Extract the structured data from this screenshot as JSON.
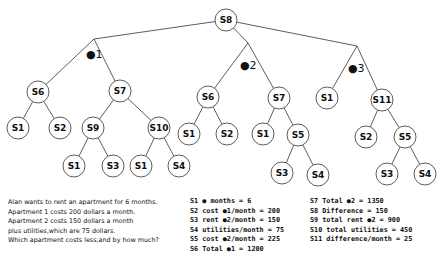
{
  "diagram": {
    "type": "tree",
    "root": "S8",
    "branches": [
      {
        "label": "#1",
        "display": "●1"
      },
      {
        "label": "#2",
        "display": "●2"
      },
      {
        "label": "#3",
        "display": "●3"
      }
    ],
    "nodes": [
      {
        "id": "n_s8",
        "label": "S8",
        "x": 226,
        "y": 20
      },
      {
        "id": "b1",
        "label": "",
        "x": 94,
        "y": 39,
        "branch": true
      },
      {
        "id": "b2",
        "label": "",
        "x": 248,
        "y": 43,
        "branch": true
      },
      {
        "id": "b3",
        "label": "",
        "x": 357,
        "y": 46,
        "branch": true
      },
      {
        "id": "n1_s6",
        "label": "S6",
        "x": 38,
        "y": 92
      },
      {
        "id": "n1_s7",
        "label": "S7",
        "x": 120,
        "y": 91
      },
      {
        "id": "n1_s1a",
        "label": "S1",
        "x": 18,
        "y": 128
      },
      {
        "id": "n1_s2",
        "label": "S2",
        "x": 60,
        "y": 128
      },
      {
        "id": "n1_s9",
        "label": "S9",
        "x": 93,
        "y": 128
      },
      {
        "id": "n1_s10",
        "label": "S10",
        "x": 159,
        "y": 128
      },
      {
        "id": "n1_s1b",
        "label": "S1",
        "x": 74,
        "y": 166
      },
      {
        "id": "n1_s3",
        "label": "S3",
        "x": 113,
        "y": 166
      },
      {
        "id": "n1_s1c",
        "label": "S1",
        "x": 141,
        "y": 166
      },
      {
        "id": "n1_s4",
        "label": "S4",
        "x": 179,
        "y": 166
      },
      {
        "id": "n2_s6",
        "label": "S6",
        "x": 208,
        "y": 97
      },
      {
        "id": "n2_s7",
        "label": "S7",
        "x": 279,
        "y": 98
      },
      {
        "id": "n2_s1a",
        "label": "S1",
        "x": 189,
        "y": 134
      },
      {
        "id": "n2_s2",
        "label": "S2",
        "x": 227,
        "y": 134
      },
      {
        "id": "n2_s1b",
        "label": "S1",
        "x": 263,
        "y": 134
      },
      {
        "id": "n2_s5",
        "label": "S5",
        "x": 298,
        "y": 135
      },
      {
        "id": "n2_s3",
        "label": "S3",
        "x": 282,
        "y": 173
      },
      {
        "id": "n2_s4",
        "label": "S4",
        "x": 318,
        "y": 175
      },
      {
        "id": "n3_s1",
        "label": "S1",
        "x": 327,
        "y": 98
      },
      {
        "id": "n3_s11",
        "label": "S11",
        "x": 382,
        "y": 100
      },
      {
        "id": "n3_s2",
        "label": "S2",
        "x": 366,
        "y": 137
      },
      {
        "id": "n3_s5",
        "label": "S5",
        "x": 405,
        "y": 137
      },
      {
        "id": "n3_s3",
        "label": "S3",
        "x": 387,
        "y": 174
      },
      {
        "id": "n3_s4",
        "label": "S4",
        "x": 425,
        "y": 174
      }
    ],
    "edges": [
      [
        "n_s8",
        "b1"
      ],
      [
        "n_s8",
        "b2"
      ],
      [
        "n_s8",
        "b3"
      ],
      [
        "b1",
        "n1_s6"
      ],
      [
        "b1",
        "n1_s7"
      ],
      [
        "n1_s6",
        "n1_s1a"
      ],
      [
        "n1_s6",
        "n1_s2"
      ],
      [
        "n1_s7",
        "n1_s9"
      ],
      [
        "n1_s7",
        "n1_s10"
      ],
      [
        "n1_s9",
        "n1_s1b"
      ],
      [
        "n1_s9",
        "n1_s3"
      ],
      [
        "n1_s10",
        "n1_s1c"
      ],
      [
        "n1_s10",
        "n1_s4"
      ],
      [
        "b2",
        "n2_s6"
      ],
      [
        "b2",
        "n2_s7"
      ],
      [
        "n2_s6",
        "n2_s1a"
      ],
      [
        "n2_s6",
        "n2_s2"
      ],
      [
        "n2_s7",
        "n2_s1b"
      ],
      [
        "n2_s7",
        "n2_s5"
      ],
      [
        "n2_s5",
        "n2_s3"
      ],
      [
        "n2_s5",
        "n2_s4"
      ],
      [
        "b3",
        "n3_s1"
      ],
      [
        "b3",
        "n3_s11"
      ],
      [
        "n3_s11",
        "n3_s2"
      ],
      [
        "n3_s11",
        "n3_s5"
      ],
      [
        "n3_s5",
        "n3_s3"
      ],
      [
        "n3_s5",
        "n3_s4"
      ]
    ],
    "branch_label_positions": [
      {
        "x": 86,
        "y": 58
      },
      {
        "x": 240,
        "y": 69
      },
      {
        "x": 348,
        "y": 72
      }
    ]
  },
  "problem": {
    "lines": [
      "Alan wants to rent an apartment for 6 months.",
      "Apartment 1 costs 200 dollars a month.",
      "Apartment 2 costs 150 dollars a month",
      "plus utilities,which are 75 dollars.",
      "Which apartment costs less,and by how much?"
    ]
  },
  "steps": {
    "left": [
      "S1  ● months = 6",
      "S2  cost ●1/month = 200",
      "S3 rent ●2/month = 150",
      "S4  utilities/month = 75",
      "S5  cost ●2/month = 225",
      "S6  Total ●1 = 1200"
    ],
    "right": [
      "S7  Total ●2 = 1350",
      "S8  Difference = 150",
      "S9  total rent ●2 = 900",
      "S10 total utilities = 450",
      "S11 difference/month = 25"
    ]
  },
  "colors": {
    "line": "#333333",
    "text": "#111111",
    "background": "#ffffff"
  }
}
